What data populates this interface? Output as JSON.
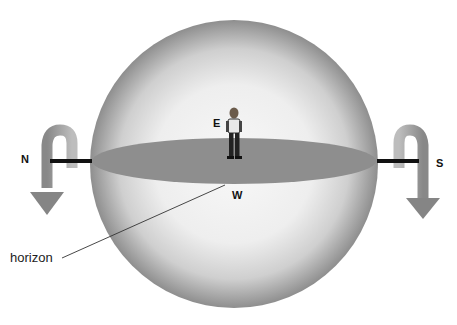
{
  "diagram": {
    "type": "celestial-sphere-rotation",
    "labels": {
      "north": "N",
      "south": "S",
      "east": "E",
      "west": "W",
      "horizon": "horizon"
    },
    "elements": {
      "sphere": "translucent celestial sphere",
      "horizon_plane": "horizontal disc through sphere",
      "axis": "north-south rotation axis",
      "observer": "person standing at center",
      "rotation_arrows": [
        "left arrow curling down near N",
        "right arrow curling down near S"
      ]
    },
    "colors": {
      "sphere_edge": "#8f8f8f",
      "sphere_center": "#f7f7f7",
      "horizon_plane": "#8c8c8c",
      "axis": "#111111",
      "arrows": "#8a8a8a"
    }
  }
}
